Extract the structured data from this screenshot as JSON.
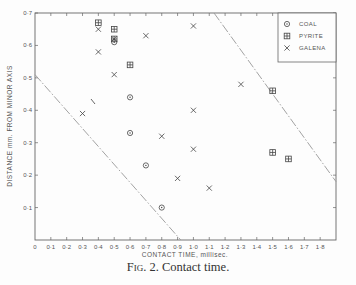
{
  "caption": {
    "fig": "Fig. 2.",
    "text": "Contact time."
  },
  "chart_data": {
    "type": "scatter",
    "title": "Fig. 2. Contact time.",
    "xlabel": "CONTACT TIME, millisec.",
    "ylabel": "DISTANCE mm. FROM MINOR AXIS",
    "xlim": [
      0,
      1.9
    ],
    "ylim": [
      0,
      0.7
    ],
    "x_ticks": [
      "0",
      "0·1",
      "0·2",
      "0·3",
      "0·4",
      "0·5",
      "0·6",
      "0·7",
      "0·8",
      "0·9",
      "1·0",
      "1·1",
      "1·2",
      "1·3",
      "1·4",
      "1·5",
      "1·6",
      "1·7",
      "1·8"
    ],
    "y_ticks": [
      "0·1",
      "0·2",
      "0·3",
      "0·4",
      "0·5",
      "0·6",
      "0·7"
    ],
    "grid": false,
    "legend_position": "upper right",
    "series": [
      {
        "name": "COAL",
        "marker": "circle-dot",
        "points": [
          [
            0.5,
            0.61
          ],
          [
            0.6,
            0.44
          ],
          [
            0.6,
            0.33
          ],
          [
            0.7,
            0.23
          ],
          [
            0.8,
            0.1
          ]
        ]
      },
      {
        "name": "PYRITE",
        "marker": "boxed-plus",
        "points": [
          [
            0.4,
            0.67
          ],
          [
            0.5,
            0.65
          ],
          [
            0.5,
            0.62
          ],
          [
            0.6,
            0.54
          ],
          [
            1.5,
            0.46
          ],
          [
            1.5,
            0.27
          ],
          [
            1.6,
            0.25
          ]
        ]
      },
      {
        "name": "GALENA",
        "marker": "x",
        "points": [
          [
            0.4,
            0.65
          ],
          [
            0.4,
            0.58
          ],
          [
            0.5,
            0.62
          ],
          [
            0.5,
            0.51
          ],
          [
            0.3,
            0.39
          ],
          [
            0.7,
            0.63
          ],
          [
            0.8,
            0.32
          ],
          [
            0.9,
            0.19
          ],
          [
            1.0,
            0.66
          ],
          [
            1.0,
            0.4
          ],
          [
            1.0,
            0.28
          ],
          [
            1.1,
            0.16
          ],
          [
            1.3,
            0.48
          ]
        ]
      }
    ],
    "boundary_lines": [
      {
        "style": "dash-dot",
        "from": [
          0.0,
          0.51
        ],
        "to": [
          0.92,
          0.0
        ]
      },
      {
        "style": "dash-dot",
        "from": [
          1.13,
          0.7
        ],
        "to": [
          1.9,
          0.18
        ]
      }
    ]
  }
}
